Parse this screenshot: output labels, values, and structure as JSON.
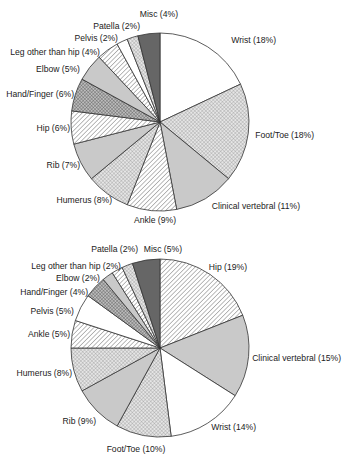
{
  "chart_data": [
    {
      "type": "pie",
      "title": "",
      "start_angle_deg": 0,
      "direction": "clockwise",
      "center": [
        160,
        122
      ],
      "radius": 89,
      "categories": [
        "Wrist",
        "Foot/Toe",
        "Clinical vertebral",
        "Ankle",
        "Humerus",
        "Rib",
        "Hip",
        "Hand/Finger",
        "Elbow",
        "Leg other than hip",
        "Pelvis",
        "Patella",
        "Misc"
      ],
      "values": [
        18,
        18,
        11,
        9,
        8,
        7,
        6,
        6,
        5,
        4,
        2,
        2,
        4
      ],
      "labels": [
        "Wrist (18%)",
        "Foot/Toe (18%)",
        "Clinical vertebral (11%)",
        "Ankle (9%)",
        "Humerus (8%)",
        "Rib (7%)",
        "Hip (6%)",
        "Hand/Finger (6%)",
        "Elbow (5%)",
        "Leg other than hip (4%)",
        "Pelvis (2%)",
        "Patella (2%)",
        "Misc (4%)"
      ],
      "fills": [
        "white",
        "cross",
        "gray",
        "hatch",
        "cross",
        "gray",
        "hatch",
        "darkcross",
        "gray",
        "hatch",
        "white",
        "cross",
        "dark"
      ],
      "label_pos": [
        [
          276,
          43,
          "end"
        ],
        [
          314,
          138,
          "end"
        ],
        [
          300,
          209,
          "end"
        ],
        [
          155,
          223,
          "middle"
        ],
        [
          112,
          203,
          "end"
        ],
        [
          80,
          168,
          "end"
        ],
        [
          70,
          131,
          "end"
        ],
        [
          74,
          97,
          "end"
        ],
        [
          80,
          72,
          "end"
        ],
        [
          100,
          55,
          "end"
        ],
        [
          118,
          41,
          "end"
        ],
        [
          140,
          29,
          "end"
        ],
        [
          178,
          17,
          "end"
        ]
      ]
    },
    {
      "type": "pie",
      "title": "",
      "start_angle_deg": 0,
      "direction": "clockwise",
      "center": [
        160,
        348
      ],
      "radius": 89,
      "categories": [
        "Hip",
        "Clinical vertebral",
        "Wrist",
        "Foot/Toe",
        "Rib",
        "Humerus",
        "Ankle",
        "Pelvis",
        "Hand/Finger",
        "Elbow",
        "Leg other than hip",
        "Patella",
        "Misc"
      ],
      "values": [
        19,
        15,
        14,
        10,
        9,
        8,
        5,
        5,
        4,
        2,
        2,
        2,
        5
      ],
      "labels": [
        "Hip (19%)",
        "Clinical vertebral (15%)",
        "Wrist (14%)",
        "Foot/Toe (10%)",
        "Rib (9%)",
        "Humerus (8%)",
        "Ankle (5%)",
        "Pelvis (5%)",
        "Hand/Finger (4%)",
        "Elbow (2%)",
        "Leg other than hip (2%)",
        "Patella (2%)",
        "Misc (5%)"
      ],
      "fills": [
        "hatch",
        "gray",
        "white",
        "cross",
        "gray",
        "cross",
        "hatch",
        "white",
        "darkcross",
        "gray",
        "hatch",
        "cross",
        "dark"
      ],
      "label_pos": [
        [
          247,
          270,
          "end"
        ],
        [
          341,
          361,
          "end"
        ],
        [
          256,
          430,
          "end"
        ],
        [
          136,
          452,
          "middle"
        ],
        [
          96,
          424,
          "end"
        ],
        [
          72,
          376,
          "end"
        ],
        [
          70,
          337,
          "end"
        ],
        [
          74,
          314,
          "end"
        ],
        [
          88,
          295,
          "end"
        ],
        [
          100,
          281,
          "end"
        ],
        [
          121,
          269,
          "end"
        ],
        [
          138,
          252,
          "end"
        ],
        [
          182,
          252,
          "end"
        ]
      ]
    }
  ],
  "colors": {
    "outline": "#333333",
    "gray": "#c9c9c9",
    "dark": "#666666",
    "white": "#ffffff",
    "hatch_line": "#555555"
  }
}
